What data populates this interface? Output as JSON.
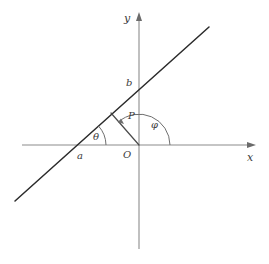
{
  "figure": {
    "background_color": "#ffffff",
    "axes": {
      "x_axis_label": "x",
      "y_axis_label": "y",
      "origin_label": "O",
      "axis_color": "#8c8c8c",
      "origin_px": {
        "x": 139,
        "y": 145
      },
      "x_axis": {
        "x1": 22,
        "y1": 145,
        "x2": 256,
        "y2": 145
      },
      "y_axis": {
        "x1": 139,
        "y1": 249,
        "x2": 139,
        "y2": 13
      }
    },
    "line": {
      "label": "slanted-line",
      "color": "#2b2b2b",
      "x_intercept_label": "a",
      "y_intercept_label": "b",
      "x_intercept_px": {
        "x": 77,
        "y": 145
      },
      "y_intercept_px": {
        "x": 139,
        "y": 89
      },
      "start_px": {
        "x": 15,
        "y": 201
      },
      "end_px": {
        "x": 209,
        "y": 27
      }
    },
    "perpendicular": {
      "label": "P",
      "color": "#4a4a4a",
      "from_px": {
        "x": 139,
        "y": 145
      },
      "to_px": {
        "x": 111,
        "y": 113
      }
    },
    "angles": [
      {
        "name": "theta",
        "label": "θ",
        "vertex_px": {
          "x": 77,
          "y": 145
        },
        "radius_px": 29,
        "label_px": {
          "x": 93,
          "y": 132
        }
      },
      {
        "name": "phi",
        "label": "φ",
        "vertex_px": {
          "x": 139,
          "y": 145
        },
        "radius_px": 31,
        "label_px": {
          "x": 151,
          "y": 120
        }
      }
    ],
    "labels": {
      "y": {
        "text": "y",
        "x": 124,
        "y": 13
      },
      "x": {
        "text": "x",
        "x": 247,
        "y": 152
      },
      "O": {
        "text": "O",
        "x": 123,
        "y": 150
      },
      "a": {
        "text": "a",
        "x": 77,
        "y": 151
      },
      "b": {
        "text": "b",
        "x": 126,
        "y": 78
      },
      "P": {
        "text": "P",
        "x": 128,
        "y": 111
      }
    }
  }
}
